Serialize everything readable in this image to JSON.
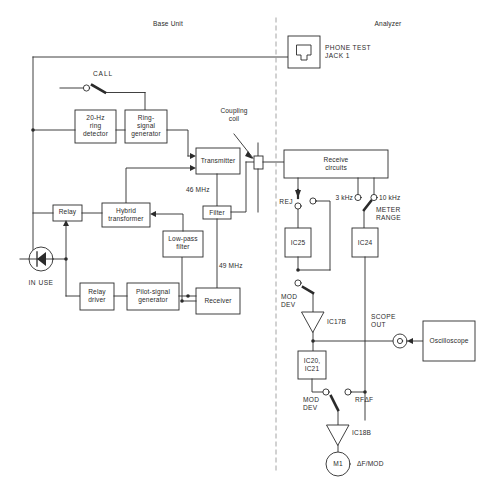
{
  "figure": {
    "top_partial_caption": "",
    "section_labels": [
      {
        "id": "base-unit",
        "text": "Base Unit"
      },
      {
        "id": "analyzer",
        "text": "Analyzer"
      }
    ]
  },
  "base_unit": {
    "blocks": [
      {
        "id": "ring-detector",
        "text": "20-Hz\nring\ndetector"
      },
      {
        "id": "ring-signal-generator",
        "text": "Ring-\nsignal\ngenerator"
      },
      {
        "id": "transmitter",
        "text": "Transmitter"
      },
      {
        "id": "filter",
        "text": "Filter"
      },
      {
        "id": "low-pass-filter",
        "text": "Low-pass\nfilter"
      },
      {
        "id": "relay",
        "text": "Relay"
      },
      {
        "id": "hybrid-transformer",
        "text": "Hybrid\ntransformer"
      },
      {
        "id": "relay-driver",
        "text": "Relay\ndriver"
      },
      {
        "id": "pilot-signal-generator",
        "text": "Pilot-signal\ngenerator"
      },
      {
        "id": "receiver",
        "text": "Receiver"
      }
    ],
    "annotations": [
      {
        "id": "call-switch-label",
        "text": "CALL"
      },
      {
        "id": "freq-46",
        "text": "46 MHz"
      },
      {
        "id": "freq-49",
        "text": "49 MHz"
      },
      {
        "id": "in-use-lamp",
        "text": "IN USE"
      },
      {
        "id": "coupling-coil",
        "text": "Coupling\ncoil"
      }
    ]
  },
  "analyzer": {
    "blocks": [
      {
        "id": "phone-test-jack",
        "text": "PHONE TEST\nJACK 1"
      },
      {
        "id": "receive-circuits",
        "text": "Receive\ncircuits"
      },
      {
        "id": "ic25",
        "text": "IC25"
      },
      {
        "id": "ic24",
        "text": "IC24"
      },
      {
        "id": "ic20-ic21",
        "text": "IC20,\nIC21"
      },
      {
        "id": "ic17b",
        "text": "IC17B"
      },
      {
        "id": "ic18b",
        "text": "IC18B"
      },
      {
        "id": "meter-m1",
        "text": "M1"
      },
      {
        "id": "oscilloscope",
        "text": "Oscilloscope"
      }
    ],
    "annotations": [
      {
        "id": "rej-switch-label",
        "text": "REJ"
      },
      {
        "id": "range-3khz",
        "text": "3 kHz"
      },
      {
        "id": "range-10khz",
        "text": "10 kHz"
      },
      {
        "id": "meter-range-label",
        "text": "METER\nRANGE"
      },
      {
        "id": "mod-dev-upper",
        "text": "MOD\nDEV"
      },
      {
        "id": "mod-dev-lower",
        "text": "MOD\nDEV"
      },
      {
        "id": "rf-delta-f",
        "text": "RFΔF"
      },
      {
        "id": "scope-out",
        "text": "SCOPE\nOUT"
      },
      {
        "id": "meter-function",
        "text": "ΔF/MOD"
      }
    ]
  },
  "colors": {
    "line": "#2b2b2b",
    "text": "#2b2b2b",
    "background": "#ffffff",
    "divider": "#9a9a9a"
  }
}
